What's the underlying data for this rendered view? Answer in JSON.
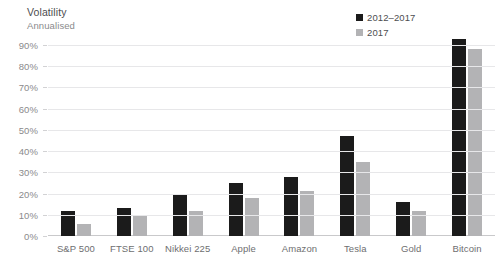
{
  "header": {
    "title": "Volatility",
    "subtitle": "Annualised"
  },
  "legend": {
    "position": "top-right",
    "items": [
      {
        "label": "2012–2017",
        "color": "#1b1b1b",
        "icon": "square-swatch-icon"
      },
      {
        "label": "2017",
        "color": "#b3b3b5",
        "icon": "square-swatch-icon"
      }
    ]
  },
  "axis": {
    "y_ticks": [
      "90%",
      "80%",
      "70%",
      "60%",
      "50%",
      "40%",
      "30%",
      "20%",
      "10%",
      "0%"
    ]
  },
  "colors": {
    "series_2012_2017": "#1b1b1b",
    "series_2017": "#b3b3b5",
    "gridline": "#e7e7e9",
    "text": "#6e6e70",
    "background": "#ffffff"
  },
  "chart_data": {
    "type": "bar",
    "title": "Volatility",
    "subtitle": "Annualised",
    "xlabel": "",
    "ylabel": "Annualised",
    "ylim": [
      0,
      90
    ],
    "ytick_step": 10,
    "ytick_suffix": "%",
    "grid": true,
    "legend_position": "top-right",
    "categories": [
      "S&P 500",
      "FTSE 100",
      "Nikkei 225",
      "Apple",
      "Amazon",
      "Tesla",
      "Gold",
      "Bitcoin"
    ],
    "series": [
      {
        "name": "2012–2017",
        "color": "#1b1b1b",
        "values": [
          12,
          13,
          20,
          25,
          28,
          47,
          16,
          93
        ]
      },
      {
        "name": "2017",
        "color": "#b3b3b5",
        "values": [
          5.5,
          10,
          12,
          18,
          21,
          35,
          12,
          88
        ]
      }
    ]
  }
}
